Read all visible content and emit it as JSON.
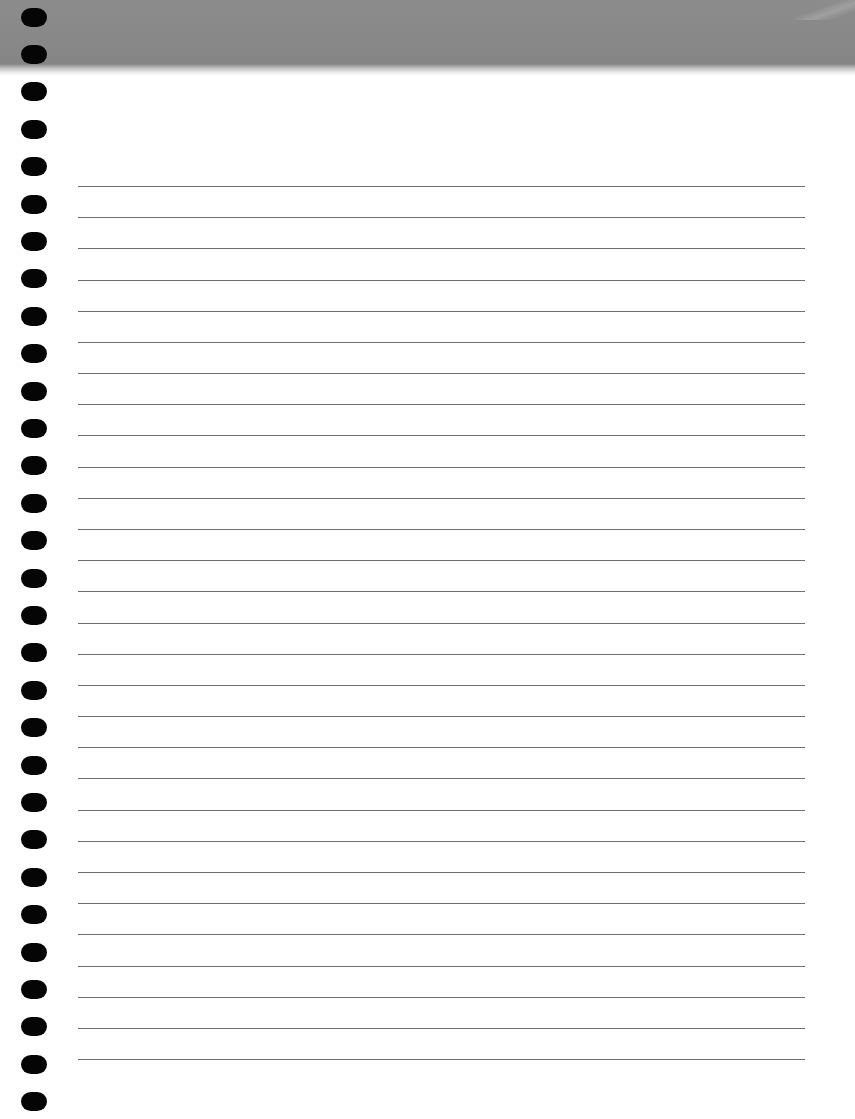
{
  "document": {
    "type": "lined-notebook-page",
    "title": "",
    "header": {
      "color": "#888888",
      "height_px": 66
    },
    "binding_holes": {
      "count": 30,
      "color": "#050505",
      "x_px": 21,
      "first_center_y_px": 17,
      "spacing_px": 37.4
    },
    "rules": {
      "count": 29,
      "color": "#6f6f6f",
      "x_start_px": 78,
      "x_end_px": 805,
      "first_y_px": 186,
      "spacing_px": 31.18
    },
    "content_text": []
  }
}
